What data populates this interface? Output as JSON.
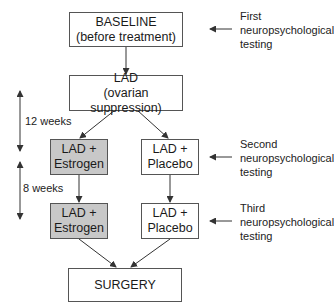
{
  "colors": {
    "shaded_box": "#c8c8c8",
    "border": "#555555",
    "line": "#333333"
  },
  "boxes": {
    "baseline": {
      "line1": "BASELINE",
      "line2": "(before treatment)"
    },
    "lad": {
      "line1": "LAD",
      "line2": "(ovarian suppression)"
    },
    "estrogen1": {
      "line1": "LAD +",
      "line2": "Estrogen"
    },
    "placebo1": {
      "line1": "LAD +",
      "line2": "Placebo"
    },
    "estrogen2": {
      "line1": "LAD +",
      "line2": "Estrogen"
    },
    "placebo2": {
      "line1": "LAD +",
      "line2": "Placebo"
    },
    "surgery": {
      "line1": "SURGERY"
    }
  },
  "notes": {
    "first": {
      "line1": "First",
      "line2": "neuropsychological",
      "line3": "testing"
    },
    "second": {
      "line1": "Second",
      "line2": "neuropsychological",
      "line3": "testing"
    },
    "third": {
      "line1": "Third",
      "line2": "neuropsychological",
      "line3": "testing"
    }
  },
  "durations": {
    "first": "12 weeks",
    "second": "8 weeks"
  }
}
